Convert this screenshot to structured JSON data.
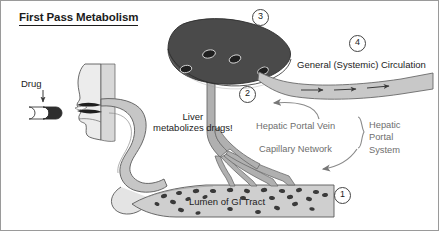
{
  "figure": {
    "title": "First Pass Metabolism",
    "type": "medical-physiology-diagram"
  },
  "labels": {
    "drug": "Drug",
    "liver_line1": "Liver",
    "liver_line2": "metabolizes drugs!",
    "general_circulation": "General (Systemic) Circulation",
    "hepatic_portal_vein": "Hepatic Portal Vein",
    "capillary_network": "Capillary Network",
    "hepatic_portal_system": [
      "Hepatic",
      "Portal",
      "System"
    ],
    "lumen": "Lumen of GI Tract"
  },
  "markers": {
    "one": "1",
    "two": "2",
    "three": "3",
    "four": "4"
  },
  "colors": {
    "ink": "#1c1c1c",
    "gray_text": "#6e6e6e",
    "liver_fill": "#4a4a4a",
    "vessel_fill": "#b5b5b5",
    "lumen_fill": "#cfcfcf",
    "body_fill": "#dcdcdc",
    "systemic_vessel": "#c8c8c8",
    "particle": "#3a3a3a",
    "outline": "#4d4d4d",
    "frame_border": "#9a9a9a"
  },
  "anatomy": {
    "head_profile": "face-profile-swallowing",
    "capsule": "drug-capsule-pill",
    "esophagus": "esophagus-tube",
    "stomach": "stomach",
    "liver": "liver-organ",
    "portal_vein": "hepatic-portal-vein-vessel",
    "capillaries": "capillary-branches",
    "gi_tract": "lumen-of-gi-tract",
    "systemic_vessel": "systemic-circulation-vessel",
    "flow_arrows": 3,
    "drug_particles": 26
  }
}
